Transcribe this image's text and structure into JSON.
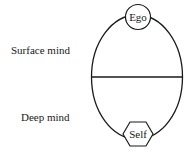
{
  "diagram": {
    "labels": {
      "surface": "Surface mind",
      "deep": "Deep mind"
    },
    "nodes": {
      "top": {
        "label": "Ego",
        "shape": "circle"
      },
      "bottom": {
        "label": "Self",
        "shape": "hexagon"
      }
    },
    "colors": {
      "stroke": "#1a1a1a",
      "background": "#ffffff"
    }
  }
}
